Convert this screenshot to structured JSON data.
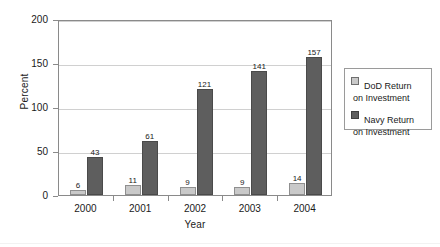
{
  "chart_data": {
    "type": "bar",
    "title": "",
    "subtitle": "",
    "xlabel": "Year",
    "ylabel": "Percent",
    "categories": [
      "2000",
      "2001",
      "2002",
      "2003",
      "2004"
    ],
    "series": [
      {
        "name": "DoD Return on Investment",
        "values": [
          6,
          11,
          9,
          9,
          14
        ],
        "color": "#c9c9c9"
      },
      {
        "name": "Navy Return on Investment",
        "values": [
          43,
          61,
          121,
          141,
          157
        ],
        "color": "#5e5e5e"
      }
    ],
    "ylim": [
      0,
      200
    ],
    "yticks": [
      0,
      50,
      100,
      150,
      200
    ],
    "ytick_labels": [
      "0",
      "50",
      "100",
      "150",
      "200"
    ],
    "grid": "horizontal",
    "data_labels": true,
    "legend_position": "right-outside"
  },
  "legend": {
    "entries": [
      {
        "line1": "DoD Return",
        "line2": "on Investment",
        "swatch": "dod-swatch"
      },
      {
        "line1": "Navy Return",
        "line2": "on Investment",
        "swatch": "navy-swatch"
      }
    ]
  }
}
